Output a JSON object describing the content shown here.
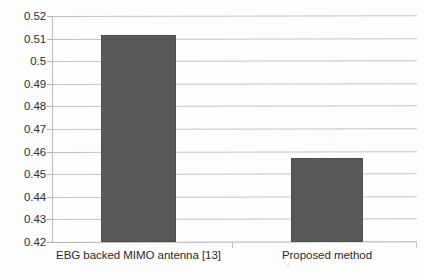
{
  "chart_data": {
    "type": "bar",
    "title": "",
    "subtitle": "",
    "xlabel": "",
    "ylabel": "",
    "categories": [
      "EBG backed MIMO antenna [13]",
      "Proposed method"
    ],
    "values": [
      0.5115,
      0.4573
    ],
    "series": [
      {
        "name": "",
        "values": [
          0.5115,
          0.4573
        ]
      }
    ],
    "ylim": [
      0.42,
      0.52
    ],
    "ytick_step": 0.01,
    "ytick_labels": [
      "0.52",
      "0.51",
      "0.5",
      "0.49",
      "0.48",
      "0.47",
      "0.46",
      "0.45",
      "0.44",
      "0.43",
      "0.42"
    ],
    "ytick_values": [
      0.52,
      0.51,
      0.5,
      0.49,
      0.48,
      0.47,
      0.46,
      0.45,
      0.44,
      0.43,
      0.42
    ],
    "grid": true,
    "grid_axis": "y",
    "legend": false,
    "legend_position": "none",
    "annotations": []
  },
  "style": {
    "bar_color": "#585858",
    "gridline_color": "#c4c4c4",
    "axis_color": "#b8b8b8",
    "text_color": "#2b2b2b",
    "background": "#fdfdfd"
  }
}
